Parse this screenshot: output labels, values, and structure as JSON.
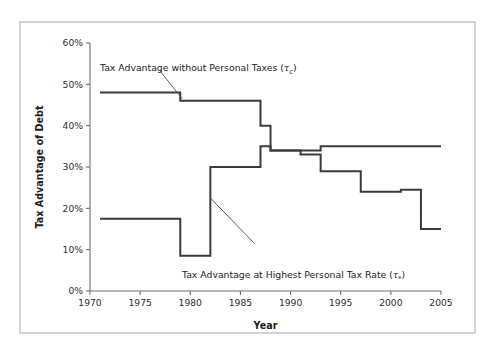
{
  "figure": {
    "background_color": "#ffffff",
    "frame_color": "#d2d4d6",
    "line_color": "#3b3b3b"
  },
  "axes": {
    "y_title": "Tax Advantage of Debt",
    "x_title": "Year",
    "y_ticks": [
      "0%",
      "10%",
      "20%",
      "30%",
      "40%",
      "50%",
      "60%"
    ],
    "x_ticks": [
      "1970",
      "1975",
      "1980",
      "1985",
      "1990",
      "1995",
      "2000",
      "2005"
    ]
  },
  "annotations": {
    "upper": {
      "text_before": "Tax Advantage without Personal Taxes (",
      "symbol": "τ",
      "sub": "c",
      "text_after": ")"
    },
    "lower": {
      "text_before": "Tax Advantage at Highest Personal Tax Rate (",
      "symbol": "τ",
      "sub": "*",
      "text_after": ")"
    }
  },
  "chart_data": {
    "type": "line",
    "title": "",
    "subtitle": "",
    "xlabel": "Year",
    "ylabel": "Tax Advantage of Debt",
    "xlim": [
      1970,
      2005
    ],
    "ylim": [
      0,
      60
    ],
    "y_unit": "%",
    "grid": false,
    "legend": "annotations-inline",
    "interpolation": "step-post",
    "series": [
      {
        "name": "Tax Advantage without Personal Taxes (tau_c)",
        "label_symbol": "τc",
        "x": [
          1971,
          1979,
          1987,
          1988,
          1993,
          2005
        ],
        "values": [
          48.0,
          46.0,
          40.0,
          34.0,
          35.0,
          35.0
        ],
        "steps": [
          {
            "from_year": 1971,
            "to_year": 1979,
            "value": 48.0
          },
          {
            "from_year": 1979,
            "to_year": 1987,
            "value": 46.0
          },
          {
            "from_year": 1987,
            "to_year": 1988,
            "value": 40.0
          },
          {
            "from_year": 1988,
            "to_year": 1993,
            "value": 34.0
          },
          {
            "from_year": 1993,
            "to_year": 2005,
            "value": 35.0
          }
        ]
      },
      {
        "name": "Tax Advantage at Highest Personal Tax Rate (tau*)",
        "label_symbol": "τ*",
        "x": [
          1971,
          1979,
          1982,
          1987,
          1988,
          1991,
          1993,
          1997,
          2001,
          2003,
          2005
        ],
        "values": [
          17.5,
          8.5,
          30.0,
          35.0,
          34.0,
          33.0,
          29.0,
          24.0,
          24.5,
          15.0,
          15.0
        ],
        "steps": [
          {
            "from_year": 1971,
            "to_year": 1979,
            "value": 17.5
          },
          {
            "from_year": 1979,
            "to_year": 1982,
            "value": 8.5
          },
          {
            "from_year": 1982,
            "to_year": 1987,
            "value": 30.0
          },
          {
            "from_year": 1987,
            "to_year": 1988,
            "value": 35.0
          },
          {
            "from_year": 1988,
            "to_year": 1991,
            "value": 34.0
          },
          {
            "from_year": 1991,
            "to_year": 1993,
            "value": 33.0
          },
          {
            "from_year": 1993,
            "to_year": 1997,
            "value": 29.0
          },
          {
            "from_year": 1997,
            "to_year": 2001,
            "value": 24.0
          },
          {
            "from_year": 2001,
            "to_year": 2003,
            "value": 24.5
          },
          {
            "from_year": 2003,
            "to_year": 2005,
            "value": 15.0
          }
        ]
      }
    ]
  }
}
